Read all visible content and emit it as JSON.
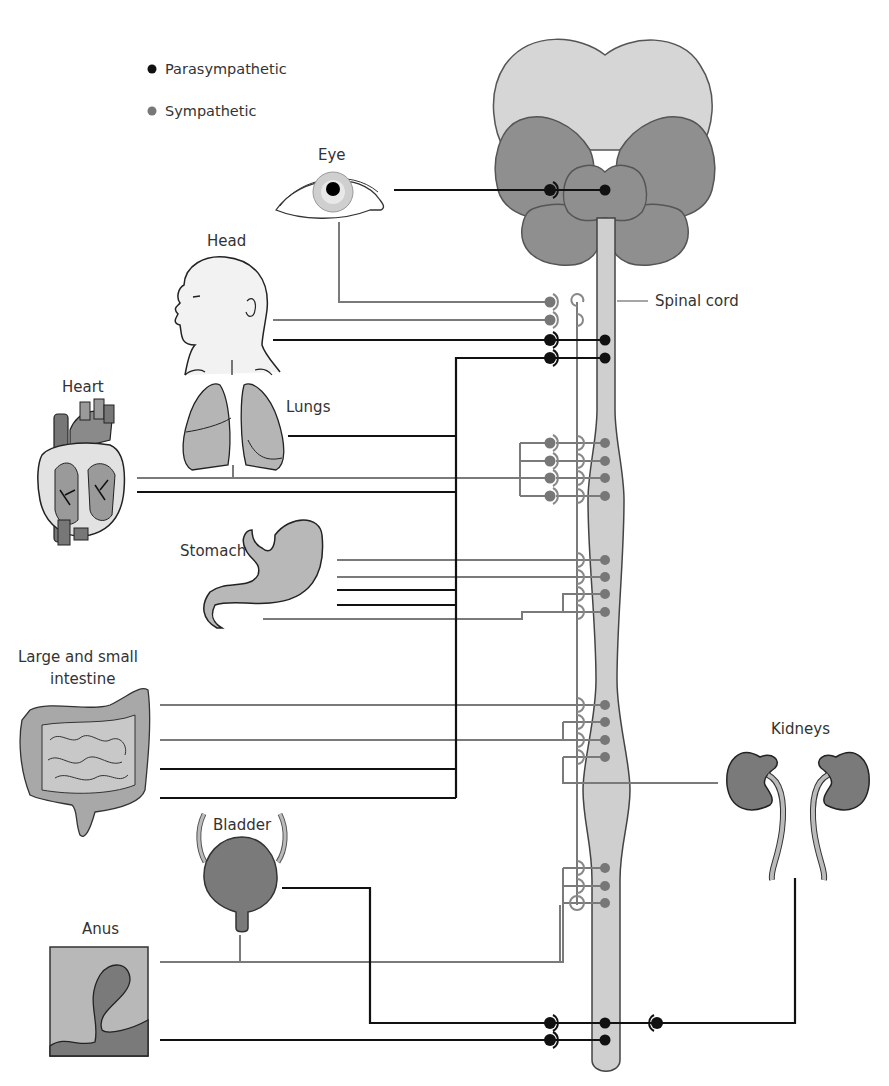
{
  "legend": {
    "parasympathetic": {
      "label": "Parasympathetic",
      "color": "#111111"
    },
    "sympathetic": {
      "label": "Sympathetic",
      "color": "#777777"
    }
  },
  "labels": {
    "eye": "Eye",
    "head": "Head",
    "heart": "Heart",
    "lungs": "Lungs",
    "stomach": "Stomach",
    "intestine_line1": "Large and small",
    "intestine_line2": "intestine",
    "bladder": "Bladder",
    "anus": "Anus",
    "kidneys": "Kidneys",
    "spinal_cord": "Spinal cord"
  },
  "colors": {
    "brain_light": "#d6d6d6",
    "brain_dark": "#8f8f8f",
    "cord": "#cfcfcf",
    "organ_light": "#bdbdbd",
    "organ_mid": "#a6a6a6",
    "organ_dark": "#7d7d7d",
    "para_line": "#111111",
    "symp_line": "#7a7a7a"
  }
}
